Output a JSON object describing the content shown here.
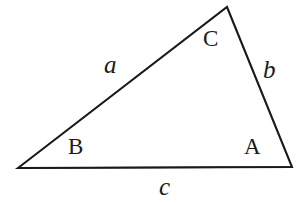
{
  "figure": {
    "type": "geometry-diagram",
    "shape": "triangle",
    "background_color": "#ffffff",
    "stroke_color": "#1a1a1a",
    "canvas": {
      "width": 300,
      "height": 203
    },
    "vertices": [
      {
        "name": "B",
        "label": "B",
        "x": 18,
        "y": 168,
        "label_x": 68,
        "label_y": 135
      },
      {
        "name": "C",
        "label": "C",
        "x": 227,
        "y": 7,
        "label_x": 203,
        "label_y": 27
      },
      {
        "name": "A",
        "label": "A",
        "x": 292,
        "y": 167,
        "label_x": 244,
        "label_y": 135
      }
    ],
    "sides": [
      {
        "name": "a",
        "label": "a",
        "between": "B-C",
        "label_x": 104,
        "label_y": 52,
        "style": "italic"
      },
      {
        "name": "b",
        "label": "b",
        "between": "C-A",
        "label_x": 263,
        "label_y": 57,
        "style": "italic"
      },
      {
        "name": "c",
        "label": "c",
        "between": "B-A",
        "label_x": 159,
        "label_y": 174,
        "style": "italic"
      }
    ],
    "path": "M 18 168 L 227 7 L 292 167 Z"
  },
  "labels": {
    "vertex_A": "A",
    "vertex_B": "B",
    "vertex_C": "C",
    "side_a": "a",
    "side_b": "b",
    "side_c": "c"
  }
}
